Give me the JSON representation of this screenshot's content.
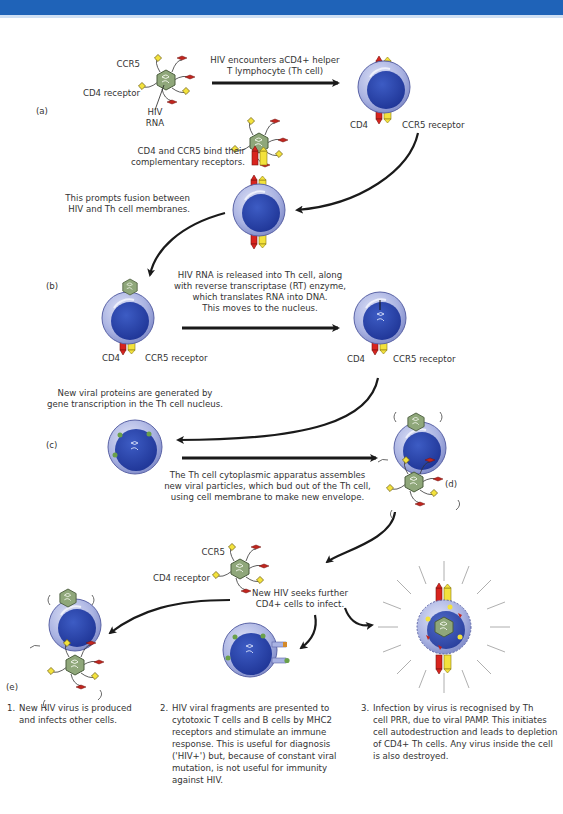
{
  "header": {
    "bar_color": "#1f63b8"
  },
  "colors": {
    "cell_membrane": "#a9b3e3",
    "cell_nucleus": "#2b44a8",
    "cd4_receptor": "#d8241e",
    "ccr5_receptor": "#f3e23c",
    "virus_capsid": "#8fa77a",
    "arrow": "#1a1a1a"
  },
  "stages": {
    "a": {
      "tag": "(a)",
      "virus_labels": {
        "ccr5": "CCR5",
        "cd4": "CD4 receptor",
        "rna": "HIV\nRNA"
      },
      "arrow_caption": "HIV encounters aCD4+ helper\nT lymphocyte (Th cell)",
      "cell_labels": {
        "cd4": "CD4",
        "ccr5": "CCR5 receptor"
      },
      "bind_caption": "CD4 and CCR5 bind their\ncomplementary receptors.",
      "fusion_caption": "This prompts fusion between\nHIV and Th cell membranes."
    },
    "b": {
      "tag": "(b)",
      "left_cell_labels": {
        "cd4": "CD4",
        "ccr5": "CCR5 receptor"
      },
      "arrow_caption": "HIV RNA is released into Th cell, along\nwith reverse transcriptase (RT) enzyme,\nwhich translates RNA into DNA.\nThis moves to the nucleus.",
      "right_cell_labels": {
        "cd4": "CD4",
        "ccr5": "CCR5 receptor"
      }
    },
    "c": {
      "tag": "(c)",
      "top_caption": "New viral proteins are generated by\ngene transcription in the Th cell nucleus.",
      "arrow_caption": "The Th cell cytoplasmic apparatus assembles\nnew viral particles, which bud out of the Th cell,\nusing cell membrane to make new envelope."
    },
    "d": {
      "tag": "(d)"
    },
    "new_virus": {
      "labels": {
        "ccr5": "CCR5",
        "cd4": "CD4 receptor"
      },
      "caption": "New HIV seeks further\nCD4+ cells to infect."
    },
    "e": {
      "tag": "(e)"
    }
  },
  "outcomes": [
    {
      "number": "1.",
      "text": "New HIV virus is produced\nand infects other cells."
    },
    {
      "number": "2.",
      "text": "HIV viral fragments are presented to\ncytotoxic T cells and B cells by MHC2\nreceptors and stimulate an immune\nresponse. This is useful for diagnosis\n('HIV+') but, because of constant viral\nmutation, is not useful for immunity\nagainst HIV."
    },
    {
      "number": "3.",
      "text": "Infection by virus is recognised by Th\ncell PRR, due to viral PAMP. This initiates\ncell autodestruction and leads to depletion\nof CD4+ Th cells.  Any virus inside the cell\nis also destroyed."
    }
  ]
}
